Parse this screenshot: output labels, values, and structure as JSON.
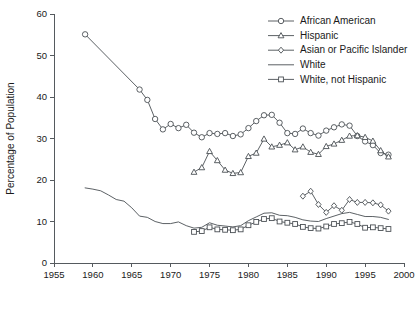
{
  "chart_data": {
    "type": "line",
    "title": "",
    "xlabel": "",
    "ylabel": "Percentage of Population",
    "xlim": [
      1955,
      2000
    ],
    "ylim": [
      0,
      60
    ],
    "xticks": [
      1955,
      1960,
      1965,
      1970,
      1975,
      1980,
      1985,
      1990,
      1995,
      2000
    ],
    "yticks": [
      0,
      10,
      20,
      30,
      40,
      50,
      60
    ],
    "grid": false,
    "legend_position": "top-right",
    "legend": [
      {
        "label": "African American",
        "marker": "circle"
      },
      {
        "label": "Hispanic",
        "marker": "triangle"
      },
      {
        "label": "Asian or Pacific Islander",
        "marker": "diamond"
      },
      {
        "label": "White",
        "marker": "none"
      },
      {
        "label": "White, not Hispanic",
        "marker": "square"
      }
    ],
    "series": [
      {
        "name": "African American",
        "marker": "circle",
        "x": [
          1959,
          1966,
          1967,
          1968,
          1969,
          1970,
          1971,
          1972,
          1973,
          1974,
          1975,
          1976,
          1977,
          1978,
          1979,
          1980,
          1981,
          1982,
          1983,
          1984,
          1985,
          1986,
          1987,
          1988,
          1989,
          1990,
          1991,
          1992,
          1993,
          1994,
          1995,
          1996,
          1997,
          1998
        ],
        "values": [
          55.1,
          41.8,
          39.3,
          34.7,
          32.2,
          33.5,
          32.5,
          33.3,
          31.4,
          30.3,
          31.3,
          31.1,
          31.3,
          30.6,
          31.0,
          32.5,
          34.2,
          35.6,
          35.7,
          33.8,
          31.3,
          31.1,
          32.4,
          31.3,
          30.7,
          31.9,
          32.7,
          33.4,
          33.1,
          30.6,
          29.3,
          28.4,
          26.5,
          26.1
        ]
      },
      {
        "name": "Hispanic",
        "marker": "triangle",
        "x": [
          1973,
          1974,
          1975,
          1976,
          1977,
          1978,
          1979,
          1980,
          1981,
          1982,
          1983,
          1984,
          1985,
          1986,
          1987,
          1988,
          1989,
          1990,
          1991,
          1992,
          1993,
          1994,
          1995,
          1996,
          1997,
          1998
        ],
        "values": [
          21.9,
          23.0,
          26.9,
          24.7,
          22.4,
          21.6,
          21.8,
          25.7,
          26.5,
          29.9,
          28.0,
          28.4,
          29.0,
          27.3,
          28.0,
          26.7,
          26.2,
          28.1,
          28.7,
          29.6,
          30.6,
          30.7,
          30.3,
          29.4,
          27.1,
          25.6
        ]
      },
      {
        "name": "Asian or Pacific Islander",
        "marker": "diamond",
        "x": [
          1987,
          1988,
          1989,
          1990,
          1991,
          1992,
          1993,
          1994,
          1995,
          1996,
          1997,
          1998
        ],
        "values": [
          16.1,
          17.3,
          14.1,
          12.2,
          13.8,
          12.7,
          15.3,
          14.6,
          14.6,
          14.5,
          14.0,
          12.5
        ]
      },
      {
        "name": "White",
        "marker": "none",
        "x": [
          1959,
          1960,
          1961,
          1962,
          1963,
          1964,
          1965,
          1966,
          1967,
          1968,
          1969,
          1970,
          1971,
          1972,
          1973,
          1974,
          1975,
          1976,
          1977,
          1978,
          1979,
          1980,
          1981,
          1982,
          1983,
          1984,
          1985,
          1986,
          1987,
          1988,
          1989,
          1990,
          1991,
          1992,
          1993,
          1994,
          1995,
          1996,
          1997,
          1998
        ],
        "values": [
          18.1,
          17.8,
          17.4,
          16.4,
          15.3,
          14.9,
          13.3,
          11.3,
          11.0,
          10.0,
          9.5,
          9.5,
          9.9,
          9.0,
          8.4,
          8.6,
          9.7,
          9.1,
          8.9,
          8.7,
          9.0,
          10.2,
          11.1,
          12.0,
          12.1,
          11.5,
          11.4,
          11.0,
          10.4,
          10.1,
          10.0,
          10.7,
          11.3,
          11.9,
          12.2,
          11.7,
          11.2,
          11.2,
          11.0,
          10.5
        ]
      },
      {
        "name": "White, not Hispanic",
        "marker": "square",
        "x": [
          1973,
          1974,
          1975,
          1976,
          1977,
          1978,
          1979,
          1980,
          1981,
          1982,
          1983,
          1984,
          1985,
          1986,
          1987,
          1988,
          1989,
          1990,
          1991,
          1992,
          1993,
          1994,
          1995,
          1996,
          1997,
          1998
        ],
        "values": [
          7.5,
          7.7,
          8.6,
          8.1,
          8.0,
          7.9,
          8.1,
          9.1,
          9.9,
          10.6,
          10.8,
          10.0,
          9.7,
          9.4,
          8.7,
          8.4,
          8.3,
          8.8,
          9.4,
          9.6,
          9.9,
          9.4,
          8.5,
          8.6,
          8.4,
          8.2
        ]
      }
    ]
  }
}
